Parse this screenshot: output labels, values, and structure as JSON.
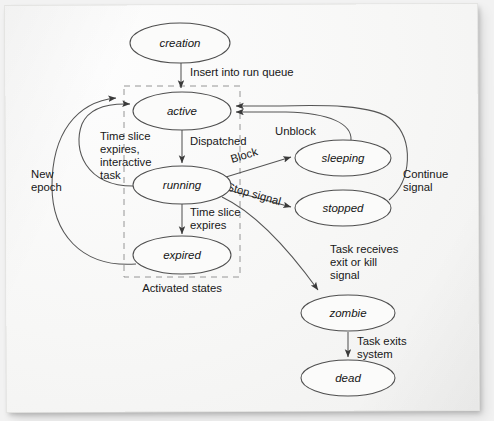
{
  "diagram": {
    "background_color": "#f2f2f2",
    "paper_color": "#f7f7f6",
    "stroke_color": "#545454"
  },
  "nodes": [
    {
      "id": "creation",
      "label": "creation",
      "cx": 180,
      "cy": 43,
      "rx": 50,
      "ry": 20
    },
    {
      "id": "active",
      "label": "active",
      "cx": 182,
      "cy": 111,
      "rx": 49,
      "ry": 19
    },
    {
      "id": "running",
      "label": "running",
      "cx": 182,
      "cy": 185,
      "rx": 49,
      "ry": 19
    },
    {
      "id": "expired",
      "label": "expired",
      "cx": 182,
      "cy": 255,
      "rx": 49,
      "ry": 19
    },
    {
      "id": "sleeping",
      "label": "sleeping",
      "cx": 343,
      "cy": 158,
      "rx": 48,
      "ry": 18
    },
    {
      "id": "stopped",
      "label": "stopped",
      "cx": 343,
      "cy": 208,
      "rx": 48,
      "ry": 18
    },
    {
      "id": "zombie",
      "label": "zombie",
      "cx": 348,
      "cy": 313,
      "rx": 47,
      "ry": 18
    },
    {
      "id": "dead",
      "label": "dead",
      "cx": 348,
      "cy": 378,
      "rx": 47,
      "ry": 18
    }
  ],
  "edges": [
    {
      "id": "creation-active",
      "from": "creation",
      "to": "active",
      "label": "Insert into run queue"
    },
    {
      "id": "active-running",
      "from": "active",
      "to": "running",
      "label": "Dispatched"
    },
    {
      "id": "running-expired",
      "from": "running",
      "to": "expired",
      "label": "Time slice\nexpires"
    },
    {
      "id": "running-active",
      "from": "running",
      "to": "active",
      "label": "Time slice\nexpires,\ninteractive\ntask"
    },
    {
      "id": "expired-active",
      "from": "expired",
      "to": "active",
      "label": "New\nepoch"
    },
    {
      "id": "running-sleeping",
      "from": "running",
      "to": "sleeping",
      "label": "Block"
    },
    {
      "id": "running-stopped",
      "from": "running",
      "to": "stopped",
      "label": "Stop signal"
    },
    {
      "id": "sleeping-active",
      "from": "sleeping",
      "to": "active",
      "label": "Unblock"
    },
    {
      "id": "stopped-active",
      "from": "stopped",
      "to": "active",
      "label": "Continue\nsignal"
    },
    {
      "id": "running-zombie",
      "from": "running",
      "to": "zombie",
      "label": "Task receives\nexit or kill\nsignal"
    },
    {
      "id": "zombie-dead",
      "from": "zombie",
      "to": "dead",
      "label": "Task exits\nsystem"
    }
  ],
  "labels": {
    "insert_into_run_queue": "Insert into run queue",
    "dispatched": "Dispatched",
    "time_slice_expires_l1": "Time slice",
    "time_slice_expires_l2": "expires",
    "time_slice_interactive_l1": "Time slice",
    "time_slice_interactive_l2": "expires,",
    "time_slice_interactive_l3": "interactive",
    "time_slice_interactive_l4": "task",
    "new_epoch_l1": "New",
    "new_epoch_l2": "epoch",
    "block": "Block",
    "stop_signal": "Stop signal",
    "unblock": "Unblock",
    "continue_signal_l1": "Continue",
    "continue_signal_l2": "signal",
    "task_receives_l1": "Task receives",
    "task_receives_l2": "exit or kill",
    "task_receives_l3": "signal",
    "task_exits_l1": "Task exits",
    "task_exits_l2": "system",
    "activated_states": "Activated states"
  },
  "groups": [
    {
      "id": "activated-states",
      "label": "Activated states",
      "x": 124,
      "y": 86,
      "width": 116,
      "height": 191
    }
  ]
}
